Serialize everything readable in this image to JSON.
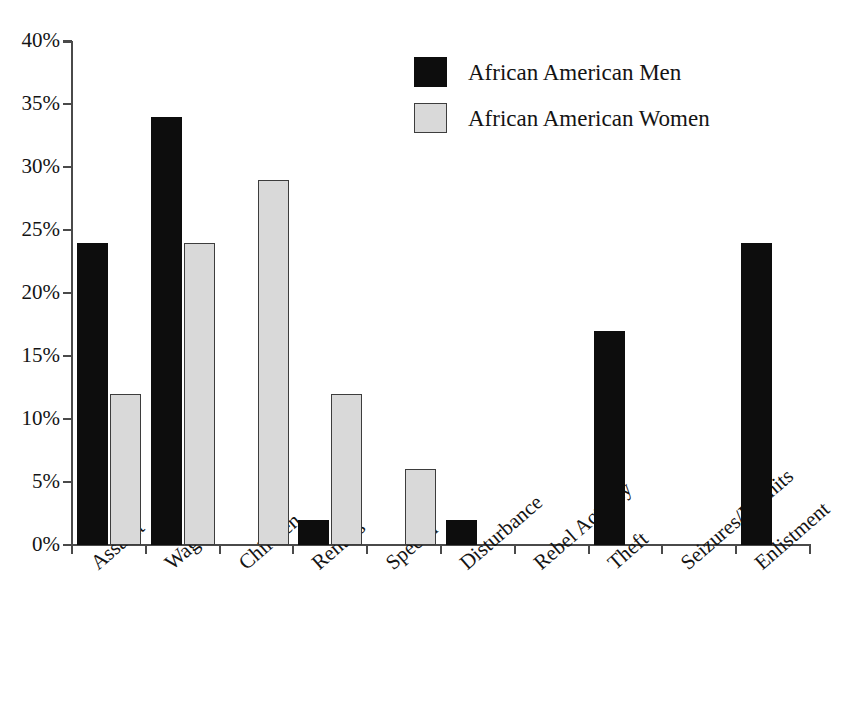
{
  "chart_data": {
    "type": "bar",
    "title": "",
    "subtitle": "",
    "xlabel": "",
    "ylabel": "",
    "ylim": [
      0,
      40
    ],
    "yticks": [
      0,
      5,
      10,
      15,
      20,
      25,
      30,
      35,
      40
    ],
    "ytick_labels": [
      "0%",
      "5%",
      "10%",
      "15%",
      "20%",
      "25%",
      "30%",
      "35%",
      "40%"
    ],
    "grid": false,
    "legend_position": "top-center",
    "value_suffix": "%",
    "categories": [
      "Assault",
      "Wages",
      "Children",
      "Rentals",
      "Speech",
      "Disturbance",
      "Rebel Activity",
      "Theft",
      "Seizures/Permits",
      "Enlistment"
    ],
    "series": [
      {
        "name": "African American Men",
        "color": "#0d0d0d",
        "border_color": "#0d0d0d",
        "values": [
          24,
          34,
          0,
          2,
          0,
          2,
          0,
          17,
          0,
          24
        ]
      },
      {
        "name": "African American Women",
        "color": "#d9d9d9",
        "border_color": "#3d3d3d",
        "values": [
          12,
          24,
          29,
          12,
          6,
          0,
          0,
          0,
          0,
          0
        ]
      }
    ]
  },
  "legend": {
    "items": [
      {
        "label": "African American Men",
        "swatch": "men"
      },
      {
        "label": "African American Women",
        "swatch": "women"
      }
    ]
  }
}
